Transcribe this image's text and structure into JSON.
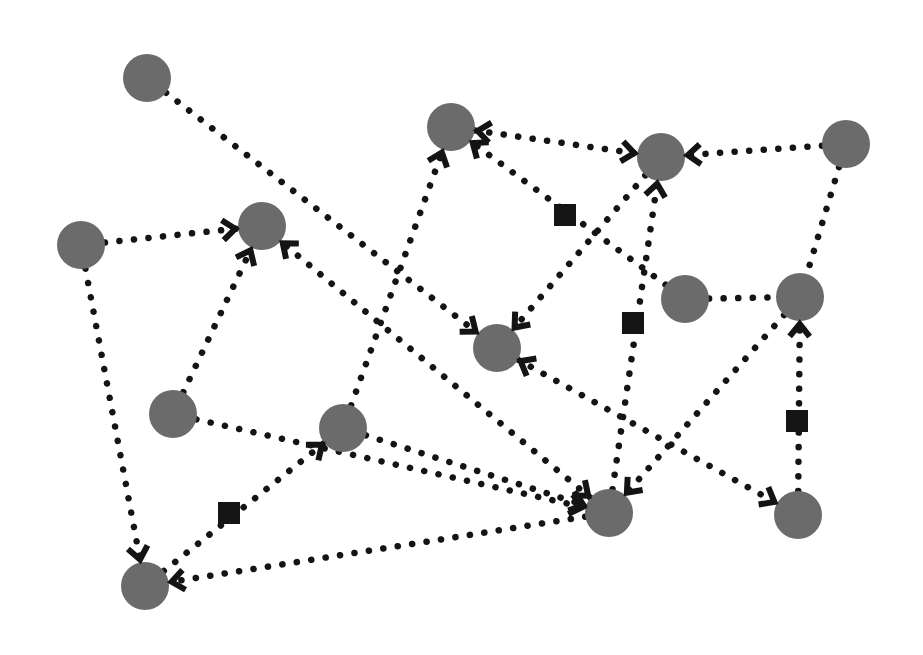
{
  "diagram": {
    "type": "directed-network",
    "background": "#ffffff",
    "node_color": "#6b6b6b",
    "edge_color": "#141414",
    "edge_style": "dotted",
    "node_radius": 24,
    "nodes": [
      {
        "id": "n1",
        "x": 147,
        "y": 78
      },
      {
        "id": "n2",
        "x": 81,
        "y": 245
      },
      {
        "id": "n3",
        "x": 262,
        "y": 226
      },
      {
        "id": "n4",
        "x": 451,
        "y": 127
      },
      {
        "id": "n5",
        "x": 661,
        "y": 157
      },
      {
        "id": "n6",
        "x": 846,
        "y": 144
      },
      {
        "id": "n7",
        "x": 685,
        "y": 299
      },
      {
        "id": "n8",
        "x": 800,
        "y": 297
      },
      {
        "id": "n9",
        "x": 497,
        "y": 348
      },
      {
        "id": "n10",
        "x": 173,
        "y": 414
      },
      {
        "id": "n11",
        "x": 343,
        "y": 428
      },
      {
        "id": "n12",
        "x": 609,
        "y": 513
      },
      {
        "id": "n13",
        "x": 798,
        "y": 515
      },
      {
        "id": "n14",
        "x": 145,
        "y": 586
      }
    ],
    "edges": [
      {
        "from": "n1",
        "to": "n9",
        "arrow_end": true,
        "arrow_start": false,
        "square": false
      },
      {
        "from": "n2",
        "to": "n3",
        "arrow_end": true,
        "arrow_start": false,
        "square": false
      },
      {
        "from": "n2",
        "to": "n14",
        "arrow_end": true,
        "arrow_start": false,
        "square": false
      },
      {
        "from": "n10",
        "to": "n3",
        "arrow_end": true,
        "arrow_start": false,
        "square": false
      },
      {
        "from": "n12",
        "to": "n3",
        "arrow_end": true,
        "arrow_start": true,
        "square": false
      },
      {
        "from": "n11",
        "to": "n4",
        "arrow_end": true,
        "arrow_start": false,
        "square": false
      },
      {
        "from": "n10",
        "to": "n12",
        "arrow_end": true,
        "arrow_start": false,
        "square": false
      },
      {
        "from": "n4",
        "to": "n5",
        "arrow_end": true,
        "arrow_start": true,
        "square": false
      },
      {
        "from": "n6",
        "to": "n5",
        "arrow_end": true,
        "arrow_start": false,
        "square": false
      },
      {
        "from": "n12",
        "to": "n5",
        "arrow_end": true,
        "arrow_start": false,
        "square": true,
        "square_x": 633,
        "square_y": 323
      },
      {
        "from": "n5",
        "to": "n9",
        "arrow_end": true,
        "arrow_start": false,
        "square": false
      },
      {
        "from": "n7",
        "to": "n4",
        "arrow_end": true,
        "arrow_start": false,
        "square": true,
        "square_x": 565,
        "square_y": 215
      },
      {
        "from": "n7",
        "to": "n8",
        "arrow_end": false,
        "arrow_start": false,
        "square": false
      },
      {
        "from": "n6",
        "to": "n8",
        "arrow_end": false,
        "arrow_start": false,
        "square": false
      },
      {
        "from": "n8",
        "to": "n12",
        "arrow_end": true,
        "arrow_start": false,
        "square": false
      },
      {
        "from": "n13",
        "to": "n8",
        "arrow_end": true,
        "arrow_start": false,
        "square": true,
        "square_x": 797,
        "square_y": 421
      },
      {
        "from": "n9",
        "to": "n13",
        "arrow_end": true,
        "arrow_start": true,
        "square": false
      },
      {
        "from": "n14",
        "to": "n11",
        "arrow_end": true,
        "arrow_start": false,
        "square": true,
        "square_x": 229,
        "square_y": 513
      },
      {
        "from": "n12",
        "to": "n14",
        "arrow_end": true,
        "arrow_start": false,
        "square": false
      },
      {
        "from": "n11",
        "to": "n12",
        "arrow_end": true,
        "arrow_start": false,
        "square": false
      }
    ]
  }
}
